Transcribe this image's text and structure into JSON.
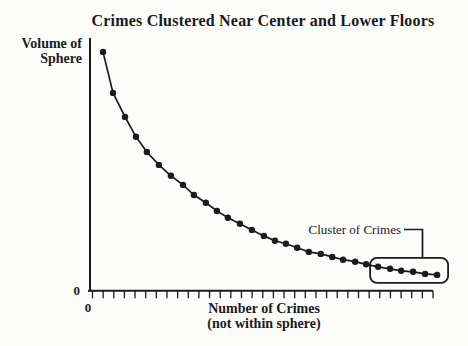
{
  "page": {
    "background_color": "#fcfcfb",
    "ink_color": "#1b1b1b"
  },
  "chart_data": {
    "type": "line",
    "title": "Crimes Clustered Near Center and Lower Floors",
    "ylabel": "Volume of Sphere",
    "ylabel_lines": [
      "Volume of",
      "Sphere"
    ],
    "xlabel": "Number of Crimes (not within sphere)",
    "xlabel_lines": [
      "Number of Crimes",
      "(not within sphere)"
    ],
    "y_origin_tick_label": "0",
    "x_origin_tick_label": "0",
    "grid": "off",
    "legend": "none",
    "axis_scale_note": "axes are qualitative; only the origin is labeled 0; units are fractions of each axis length",
    "x_tick_count": 33,
    "marker": "filled-circle",
    "curve_color": "#1b1b1b",
    "xlim": [
      0,
      1
    ],
    "ylim": [
      0,
      1
    ],
    "points": [
      [
        0.038,
        0.945
      ],
      [
        0.067,
        0.783
      ],
      [
        0.102,
        0.688
      ],
      [
        0.134,
        0.609
      ],
      [
        0.166,
        0.549
      ],
      [
        0.201,
        0.498
      ],
      [
        0.236,
        0.455
      ],
      [
        0.271,
        0.419
      ],
      [
        0.303,
        0.379
      ],
      [
        0.338,
        0.348
      ],
      [
        0.37,
        0.316
      ],
      [
        0.402,
        0.289
      ],
      [
        0.437,
        0.265
      ],
      [
        0.472,
        0.241
      ],
      [
        0.507,
        0.217
      ],
      [
        0.539,
        0.198
      ],
      [
        0.571,
        0.186
      ],
      [
        0.604,
        0.17
      ],
      [
        0.638,
        0.154
      ],
      [
        0.673,
        0.146
      ],
      [
        0.706,
        0.134
      ],
      [
        0.738,
        0.123
      ],
      [
        0.773,
        0.115
      ],
      [
        0.805,
        0.105
      ],
      [
        0.84,
        0.095
      ],
      [
        0.875,
        0.087
      ],
      [
        0.907,
        0.079
      ],
      [
        0.942,
        0.075
      ],
      [
        0.977,
        0.067
      ],
      [
        1.012,
        0.063
      ]
    ],
    "annotation": {
      "label": "Cluster of Crimes",
      "enclosed_point_start_index": 24,
      "enclosed_point_end_index": 29
    }
  }
}
